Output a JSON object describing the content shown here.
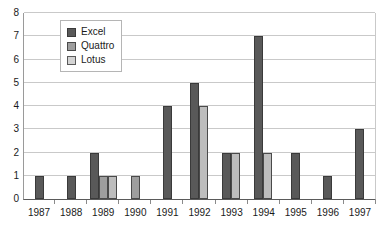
{
  "chart_data": {
    "type": "bar",
    "title": "",
    "xlabel": "",
    "ylabel": "",
    "categories": [
      "1987",
      "1988",
      "1989",
      "1990",
      "1991",
      "1992",
      "1993",
      "1994",
      "1995",
      "1996",
      "1997"
    ],
    "series": [
      {
        "name": "Excel",
        "color": "#595959",
        "values": [
          1,
          1,
          2,
          0,
          4,
          5,
          2,
          7,
          2,
          1,
          3
        ]
      },
      {
        "name": "Quattro",
        "color": "#9e9e9e",
        "values": [
          0,
          0,
          1,
          1,
          0,
          0,
          0,
          0,
          0,
          0,
          0
        ]
      },
      {
        "name": "Lotus",
        "color": "#bdbdbd",
        "values": [
          0,
          0,
          1,
          0,
          0,
          4,
          2,
          2,
          0,
          0,
          0
        ]
      }
    ],
    "ylim": [
      0,
      8
    ],
    "y_ticks": [
      "0",
      "1",
      "2",
      "3",
      "4",
      "5",
      "6",
      "7",
      "8"
    ],
    "grid": true,
    "legend_position": "top-left-inside"
  },
  "legend": {
    "items": [
      {
        "label": "Excel"
      },
      {
        "label": "Quattro"
      },
      {
        "label": "Lotus"
      }
    ]
  }
}
